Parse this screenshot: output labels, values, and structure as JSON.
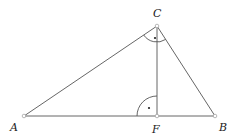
{
  "diagram": {
    "type": "geometry",
    "points": {
      "A": {
        "label": "A",
        "x": 24,
        "y": 116
      },
      "B": {
        "label": "B",
        "x": 215,
        "y": 116
      },
      "C": {
        "label": "C",
        "x": 157,
        "y": 26
      },
      "F": {
        "label": "F",
        "x": 157,
        "y": 116
      }
    },
    "segments": [
      "AB",
      "BC",
      "CA",
      "CF"
    ],
    "angle_marks": [
      {
        "vertex": "C",
        "type": "right-angle",
        "between": [
          "CA",
          "CB"
        ]
      },
      {
        "vertex": "F",
        "type": "right-angle",
        "between": [
          "FA",
          "FC"
        ]
      }
    ],
    "colors": {
      "line": "#555555",
      "label": "#222222",
      "point_fill": "#ffffff"
    }
  }
}
